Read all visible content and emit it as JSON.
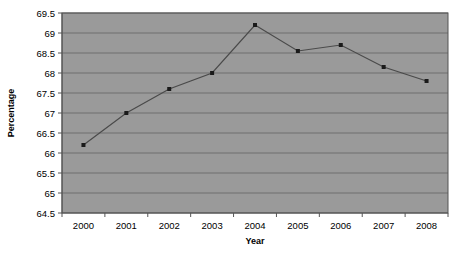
{
  "chart_data": {
    "type": "line",
    "title": "",
    "xlabel": "Year",
    "ylabel": "Percentage",
    "categories": [
      "2000",
      "2001",
      "2002",
      "2003",
      "2004",
      "2005",
      "2006",
      "2007",
      "2008"
    ],
    "x": [
      2000,
      2001,
      2002,
      2003,
      2004,
      2005,
      2006,
      2007,
      2008
    ],
    "values": [
      66.2,
      67.0,
      67.6,
      68.0,
      69.2,
      68.55,
      68.7,
      68.15,
      67.8
    ],
    "series": [
      {
        "name": "Percentage",
        "values": [
          66.2,
          67.0,
          67.6,
          68.0,
          69.2,
          68.55,
          68.7,
          68.15,
          67.8
        ]
      }
    ],
    "ylim": [
      64.5,
      69.5
    ],
    "ytick_step": 0.5,
    "ytick_labels": [
      "64.5",
      "65",
      "65.5",
      "66",
      "66.5",
      "67",
      "67.5",
      "68",
      "68.5",
      "69",
      "69.5"
    ],
    "ytick_values": [
      64.5,
      65,
      65.5,
      66,
      66.5,
      67,
      67.5,
      68,
      68.5,
      69,
      69.5
    ],
    "grid": "horizontal",
    "legend": "none",
    "marker": "square",
    "colors": {
      "plot_background": "#9a9a9a",
      "gridline": "#6f6f6f",
      "line": "#4a4a4a",
      "marker": "#1a1a1a",
      "axis": "#555555",
      "text": "#000000",
      "page_background": "#ffffff"
    }
  }
}
